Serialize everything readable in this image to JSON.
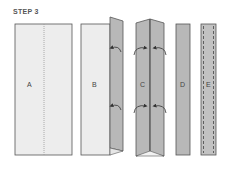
{
  "step": {
    "label": "STEP 3"
  },
  "panels": [
    {
      "id": "A",
      "label": "A",
      "description": "flat fabric strip with center fold line"
    },
    {
      "id": "B",
      "label": "B",
      "description": "one edge folded in toward center"
    },
    {
      "id": "C",
      "label": "C",
      "description": "both edges folded to center"
    },
    {
      "id": "D",
      "label": "D",
      "description": "folded in half"
    },
    {
      "id": "E",
      "label": "E",
      "description": "edge-stitched strip"
    }
  ],
  "colors": {
    "paper": "#ededed",
    "fold": "#b8b8b8",
    "outline": "#555555",
    "dotted_line": "#999999",
    "stitch": "#444444",
    "arrow": "#333333"
  }
}
